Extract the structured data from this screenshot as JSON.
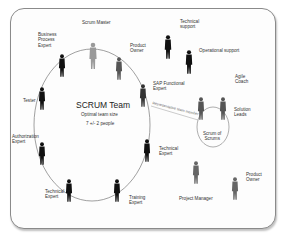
{
  "diagram": {
    "team_title": "SCRUM Team",
    "team_subtitle": "Optimal team size",
    "team_size": "7 +/- 2 people",
    "connector_label": "Representative team member",
    "scrum_of_scrums": "Scrum of\nScrums",
    "team_roles": [
      {
        "label": "Scrum Master"
      },
      {
        "label": "Business\nProcess\nExpert"
      },
      {
        "label": "Product\nOwner"
      },
      {
        "label": "Tester"
      },
      {
        "label": "SAP Functional\nExpert"
      },
      {
        "label": "Authorization\nExpert"
      },
      {
        "label": "Technical\nExpert"
      },
      {
        "label": "Training\nExpert"
      },
      {
        "label": "Technical\nExpert"
      }
    ],
    "external_roles": [
      {
        "label": "Technical\nsupport"
      },
      {
        "label": "Operational support"
      },
      {
        "label": "Agile\nCoach"
      },
      {
        "label": "Solution\nLeads"
      },
      {
        "label": "Project Manager"
      },
      {
        "label": "Product\nOwner"
      }
    ]
  }
}
